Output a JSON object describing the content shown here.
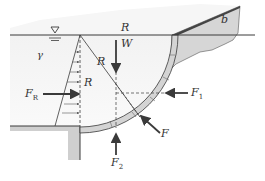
{
  "figure": {
    "type": "curved gate hydrostatic force diagram",
    "labels": {
      "radius_top": "R",
      "radius_diag": "R",
      "radius_mid": "R",
      "weight": "W",
      "width": "b",
      "specific_weight": "γ",
      "horizontal_resultant": "F",
      "horizontal_resultant_sub": "R",
      "force_1": "F",
      "force_1_sub": "1",
      "force_2": "F",
      "force_2_sub": "2",
      "resultant": "F"
    },
    "colors": {
      "water": "#ececec",
      "gate_fill": "#d4d4d4",
      "ground": "#cfcfcf",
      "line": "#3a3a3a"
    }
  }
}
